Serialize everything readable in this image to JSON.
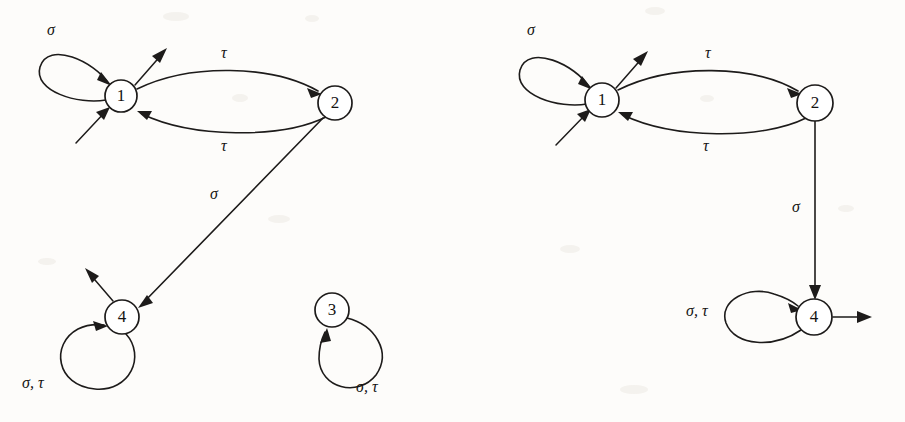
{
  "figure": {
    "background_color": "#fdfcfa",
    "ink_color": "#1d1b1a",
    "alphabet": [
      "sigma",
      "tau"
    ],
    "symbols": {
      "sigma": "σ",
      "tau": "τ",
      "sigma_tau": "σ, τ"
    }
  },
  "left_diagram": {
    "name": "left-automaton",
    "states": [
      {
        "id": "1",
        "label": "1",
        "cx": 121,
        "cy": 96,
        "r": 16,
        "initial": true,
        "marked": false
      },
      {
        "id": "2",
        "label": "2",
        "cx": 335,
        "cy": 103,
        "r": 17,
        "initial": false,
        "marked": false
      },
      {
        "id": "4",
        "label": "4",
        "cx": 122,
        "cy": 317,
        "r": 17,
        "initial": false,
        "marked": true
      },
      {
        "id": "3",
        "label": "3",
        "cx": 332,
        "cy": 310,
        "r": 17,
        "initial": false,
        "marked": false
      }
    ],
    "transitions": [
      {
        "from": "1",
        "to": "1",
        "label": "σ",
        "kind": "self-loop-upper-left"
      },
      {
        "from": "1",
        "to": "2",
        "label": "τ",
        "kind": "curve-top"
      },
      {
        "from": "2",
        "to": "1",
        "label": "τ",
        "kind": "curve-bottom"
      },
      {
        "from": "2",
        "to": "4",
        "label": "σ",
        "kind": "diagonal"
      },
      {
        "from": "4",
        "to": "4",
        "label": "σ, τ",
        "kind": "self-loop-lower-left"
      },
      {
        "from": "3",
        "to": "3",
        "label": "σ, τ",
        "kind": "self-loop-lower-right"
      }
    ],
    "markers": [
      {
        "type": "initial-arrow",
        "state": "1",
        "direction": "from lower-left"
      },
      {
        "type": "marked-arrow",
        "state": "1",
        "direction": "to upper-right"
      },
      {
        "type": "marked-arrow",
        "state": "4",
        "direction": "to upper-left"
      }
    ],
    "labels": [
      {
        "text": "σ",
        "x": 47,
        "y": 22
      },
      {
        "text": "τ",
        "x": 221,
        "y": 45
      },
      {
        "text": "τ",
        "x": 221,
        "y": 138
      },
      {
        "text": "σ",
        "x": 210,
        "y": 186
      },
      {
        "text": "σ, τ",
        "x": 22,
        "y": 375
      },
      {
        "text": "σ, τ",
        "x": 356,
        "y": 379
      }
    ]
  },
  "right_diagram": {
    "name": "right-automaton",
    "states": [
      {
        "id": "1",
        "label": "1",
        "cx": 602,
        "cy": 100,
        "r": 17,
        "initial": true,
        "marked": true
      },
      {
        "id": "2",
        "label": "2",
        "cx": 815,
        "cy": 103,
        "r": 18,
        "initial": false,
        "marked": false
      },
      {
        "id": "4",
        "label": "4",
        "cx": 814,
        "cy": 317,
        "r": 18,
        "initial": false,
        "marked": true
      }
    ],
    "transitions": [
      {
        "from": "1",
        "to": "1",
        "label": "σ",
        "kind": "self-loop-upper-left"
      },
      {
        "from": "1",
        "to": "2",
        "label": "τ",
        "kind": "curve-top"
      },
      {
        "from": "2",
        "to": "1",
        "label": "τ",
        "kind": "curve-bottom"
      },
      {
        "from": "2",
        "to": "4",
        "label": "σ",
        "kind": "vertical"
      },
      {
        "from": "4",
        "to": "4",
        "label": "σ, τ",
        "kind": "self-loop-left"
      }
    ],
    "markers": [
      {
        "type": "initial-arrow",
        "state": "1",
        "direction": "from lower-left"
      },
      {
        "type": "marked-arrow",
        "state": "1",
        "direction": "to upper-right"
      },
      {
        "type": "marked-arrow",
        "state": "4",
        "direction": "to right"
      }
    ],
    "labels": [
      {
        "text": "σ",
        "x": 527,
        "y": 22
      },
      {
        "text": "τ",
        "x": 705,
        "y": 45
      },
      {
        "text": "τ",
        "x": 703,
        "y": 138
      },
      {
        "text": "σ",
        "x": 792,
        "y": 199
      },
      {
        "text": "σ, τ",
        "x": 686,
        "y": 303
      }
    ]
  }
}
